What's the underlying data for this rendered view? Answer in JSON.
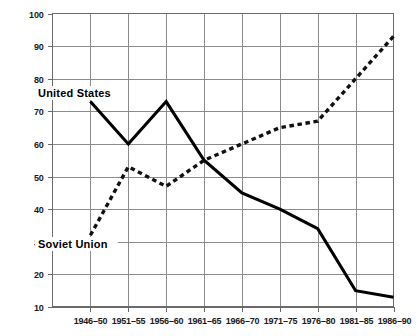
{
  "chart_data": {
    "type": "line",
    "title": "",
    "xlabel": "",
    "ylabel": "",
    "categories": [
      "1946–50",
      "1951–55",
      "1956–60",
      "1961–65",
      "1966–70",
      "1971–75",
      "1976–80",
      "1981–85",
      "1986–90"
    ],
    "series": [
      {
        "name": "United States",
        "style": "solid",
        "values": [
          73,
          60,
          73,
          55,
          45,
          40,
          34,
          15,
          13
        ]
      },
      {
        "name": "Soviet Union",
        "style": "dotted",
        "values": [
          32,
          53,
          47,
          55,
          60,
          65,
          67,
          80,
          93
        ]
      }
    ],
    "ylim": [
      10,
      100
    ],
    "yticks": [
      10,
      20,
      30,
      40,
      50,
      60,
      70,
      80,
      90,
      100
    ],
    "ytick_labels": [
      "10",
      "20",
      "30",
      "40",
      "50",
      "60",
      "70",
      "80",
      "90",
      "100"
    ],
    "grid": true,
    "legend_position": "inline-annotations",
    "annotations": [
      {
        "text": "United States",
        "series": "United States"
      },
      {
        "text": "Soviet Union",
        "series": "Soviet Union"
      }
    ],
    "colors": {
      "series_united_states": "#000000",
      "series_soviet_union": "#111111",
      "gridline": "#8c8c8c",
      "frame": "#6b6b6b",
      "text": "#1a1a1a",
      "background": "#ffffff"
    }
  }
}
